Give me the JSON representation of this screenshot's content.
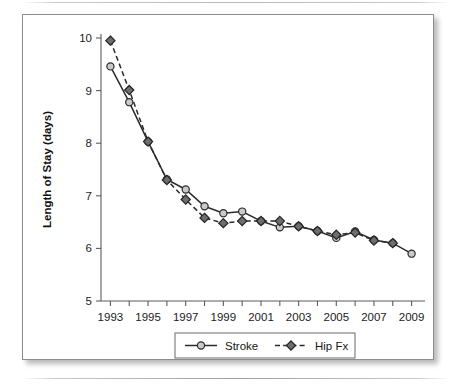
{
  "figure": {
    "y_axis_title": "Length of Stay (days)"
  },
  "chart_data": {
    "type": "line",
    "title": "",
    "subtitle": "",
    "xlabel": "",
    "ylabel": "Length of Stay (days)",
    "xlim": [
      1992.5,
      2009.5
    ],
    "ylim": [
      5,
      10
    ],
    "grid": false,
    "legend_position": "bottom-center",
    "x": [
      1993,
      1994,
      1995,
      1996,
      1997,
      1998,
      1999,
      2000,
      2001,
      2002,
      2003,
      2004,
      2005,
      2006,
      2007,
      2008,
      2009
    ],
    "xtick_labels": [
      "1993",
      "1995",
      "1997",
      "1999",
      "2001",
      "2003",
      "2005",
      "2007",
      "2009"
    ],
    "xtick_values": [
      1993,
      1995,
      1997,
      1999,
      2001,
      2003,
      2005,
      2007,
      2009
    ],
    "ytick_labels": [
      "5",
      "6",
      "7",
      "8",
      "9",
      "10"
    ],
    "ytick_values": [
      5,
      6,
      7,
      8,
      9,
      10
    ],
    "series": [
      {
        "name": "Stroke",
        "marker": "open-circle",
        "line_style": "solid",
        "color": "#2b2b2b",
        "x": [
          1993,
          1994,
          1995,
          1996,
          1997,
          1998,
          1999,
          2000,
          2001,
          2002,
          2003,
          2004,
          2005,
          2006,
          2007,
          2008,
          2009
        ],
        "values": [
          9.46,
          8.78,
          8.03,
          7.31,
          7.12,
          6.8,
          6.67,
          6.7,
          6.52,
          6.4,
          6.42,
          6.33,
          6.2,
          6.32,
          6.16,
          6.1,
          5.9
        ]
      },
      {
        "name": "Hip Fx",
        "marker": "filled-diamond",
        "line_style": "dashed",
        "color": "#2b2b2b",
        "x": [
          1993,
          1994,
          1995,
          1996,
          1997,
          1998,
          1999,
          2000,
          2001,
          2002,
          2003,
          2004,
          2005,
          2006,
          2007,
          2008
        ],
        "values": [
          9.95,
          9.01,
          8.03,
          7.3,
          6.93,
          6.58,
          6.48,
          6.52,
          6.52,
          6.52,
          6.42,
          6.33,
          6.26,
          6.3,
          6.15,
          6.1
        ]
      }
    ],
    "legend": [
      {
        "label": "Stroke",
        "marker": "open-circle",
        "line_style": "solid"
      },
      {
        "label": "Hip Fx",
        "marker": "filled-diamond",
        "line_style": "dashed"
      }
    ]
  }
}
